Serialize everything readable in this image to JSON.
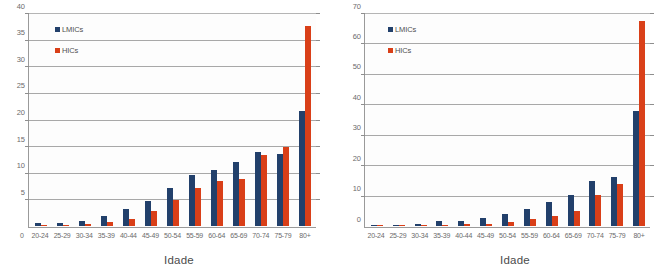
{
  "figure": {
    "legend_labels": {
      "lmics": "LMICs",
      "hics": "HICs"
    },
    "colors": {
      "lmics": "#22406b",
      "hics": "#d93f18",
      "gridline": "#a8a8a8",
      "axis": "#9a9a9a",
      "text": "#6b6b6b"
    }
  },
  "chart_data": [
    {
      "type": "bar",
      "title": "",
      "xlabel": "Idade",
      "ylabel": "",
      "categories": [
        "20-24",
        "25-29",
        "30-34",
        "35-39",
        "40-44",
        "45-49",
        "50-54",
        "55-59",
        "60-64",
        "65-69",
        "70-74",
        "75-79",
        "80+"
      ],
      "series": [
        {
          "name": "LMICs",
          "color": "#22406b",
          "values": [
            0.5,
            0.5,
            1.0,
            1.9,
            3.3,
            4.7,
            7.2,
            9.7,
            10.6,
            12.1,
            13.9,
            13.6,
            21.7
          ]
        },
        {
          "name": "HICs",
          "color": "#d93f18",
          "values": [
            0.1,
            0.2,
            0.4,
            0.7,
            1.3,
            2.9,
            5.0,
            7.1,
            8.5,
            8.9,
            13.4,
            14.9,
            37.8
          ]
        }
      ],
      "ylim": [
        0,
        40
      ],
      "ytick_step": 5,
      "yticks": [
        0,
        5,
        10,
        15,
        20,
        25,
        30,
        35,
        40
      ],
      "grid": true,
      "legend_position": "upper-left"
    },
    {
      "type": "bar",
      "title": "",
      "xlabel": "Idade",
      "ylabel": "",
      "categories": [
        "20-24",
        "25-29",
        "30-34",
        "35-39",
        "40-44",
        "45-49",
        "50-54",
        "55-59",
        "60-64",
        "65-69",
        "70-74",
        "75-79",
        "80+"
      ],
      "series": [
        {
          "name": "LMICs",
          "color": "#22406b",
          "values": [
            0.3,
            0.4,
            0.7,
            1.5,
            1.6,
            2.5,
            4.0,
            5.7,
            7.8,
            10.4,
            14.7,
            16.1,
            37.9
          ]
        },
        {
          "name": "HICs",
          "color": "#d93f18",
          "values": [
            0.1,
            0.1,
            0.2,
            0.3,
            0.6,
            0.8,
            1.2,
            2.3,
            3.4,
            4.8,
            10.1,
            14.0,
            67.8
          ]
        }
      ],
      "ylim": [
        0,
        70
      ],
      "ytick_step": 10,
      "yticks": [
        0,
        10,
        20,
        30,
        40,
        50,
        60,
        70
      ],
      "grid": true,
      "legend_position": "upper-left"
    }
  ]
}
